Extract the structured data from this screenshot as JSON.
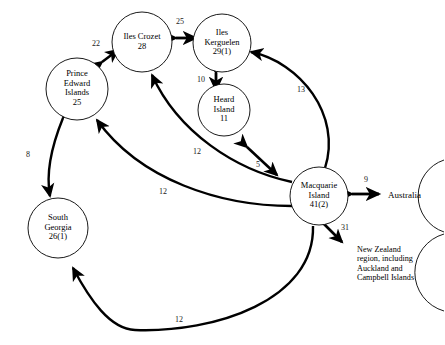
{
  "figure": {
    "type": "network-diagram",
    "background_color": "#ffffff",
    "line_color": "#000000"
  },
  "nodes": [
    {
      "id": "prince-edward-islands",
      "label": "Prince\nEdward\nIslands\n25",
      "name": "Prince Edward Islands",
      "value": "25",
      "shape": "circle",
      "cx": 77,
      "cy": 89,
      "r": 31
    },
    {
      "id": "iles-crozet",
      "label": "Iles Crozet\n28",
      "name": "Iles Crozet",
      "value": "28",
      "shape": "circle",
      "cx": 142,
      "cy": 42,
      "r": 30
    },
    {
      "id": "iles-kerguelen",
      "label": "Iles\nKerguelen\n29(1)",
      "name": "Iles Kerguelen",
      "value": "29(1)",
      "shape": "circle",
      "cx": 222,
      "cy": 43,
      "r": 29
    },
    {
      "id": "heard-island",
      "label": "Heard\nIsland\n11",
      "name": "Heard Island",
      "value": "11",
      "shape": "circle",
      "cx": 224,
      "cy": 110,
      "r": 26
    },
    {
      "id": "macquarie-island",
      "label": "Macquarie\nIsland\n41(2)",
      "name": "Macquarie Island",
      "value": "41(2)",
      "shape": "circle",
      "cx": 319,
      "cy": 196,
      "r": 29
    },
    {
      "id": "south-georgia",
      "label": "South\nGeorgia\n26(1)",
      "name": "South Georgia",
      "value": "26(1)",
      "shape": "circle",
      "cx": 58,
      "cy": 228,
      "r": 30
    },
    {
      "id": "australia",
      "label": "Australia",
      "name": "Australia",
      "shape": "arc-open-right",
      "cx": 420,
      "cy": 196,
      "r": 38
    },
    {
      "id": "new-zealand-region",
      "label": "New Zealand\nregion, including\nAuckland and\nCampbell Islands",
      "name": "New Zealand region",
      "shape": "arc-open-right",
      "cx": 420,
      "cy": 272,
      "r": 40
    }
  ],
  "edges": [
    {
      "id": "crozet-kerguelen",
      "label": "25",
      "from": "iles-crozet",
      "to": "iles-kerguelen",
      "arrows": "double",
      "style": "straight",
      "label_x": 179,
      "label_y": 22
    },
    {
      "id": "prince-edward-crozet",
      "label": "22",
      "from": "prince-edward-islands",
      "to": "iles-crozet",
      "arrows": "double",
      "style": "straight-diagonal",
      "label_x": 95,
      "label_y": 44
    },
    {
      "id": "kerguelen-heard",
      "label": "10",
      "from": "iles-kerguelen",
      "to": "heard-island",
      "arrows": "double",
      "style": "straight",
      "label_x": 200,
      "label_y": 80
    },
    {
      "id": "heard-macquarie",
      "label": "5",
      "from": "heard-island",
      "to": "macquarie-island",
      "arrows": "double",
      "style": "straight-diagonal",
      "label_x": 258,
      "label_y": 165
    },
    {
      "id": "macquarie-kerguelen",
      "label": "13",
      "from": "macquarie-island",
      "to": "iles-kerguelen",
      "arrows": "double",
      "style": "curved",
      "label_x": 300,
      "label_y": 90
    },
    {
      "id": "macquarie-crozet",
      "label": "12",
      "from": "macquarie-island",
      "to": "iles-crozet",
      "arrows": "single",
      "style": "curved",
      "label_x": 196,
      "label_y": 152
    },
    {
      "id": "macquarie-prince-edward",
      "label": "12",
      "from": "macquarie-island",
      "to": "prince-edward-islands",
      "arrows": "single",
      "style": "curved",
      "label_x": 162,
      "label_y": 192
    },
    {
      "id": "macquarie-south-georgia",
      "label": "12",
      "from": "macquarie-island",
      "to": "south-georgia",
      "arrows": "single",
      "style": "curved",
      "label_x": 178,
      "label_y": 320
    },
    {
      "id": "prince-edward-south-georgia",
      "label": "8",
      "from": "prince-edward-islands",
      "to": "south-georgia",
      "arrows": "double",
      "style": "curved",
      "label_x": 28,
      "label_y": 155
    },
    {
      "id": "macquarie-australia",
      "label": "9",
      "from": "macquarie-island",
      "to": "australia",
      "arrows": "double",
      "style": "straight",
      "label_x": 365,
      "label_y": 180
    },
    {
      "id": "macquarie-new-zealand",
      "label": "31",
      "from": "macquarie-island",
      "to": "new-zealand-region",
      "arrows": "double",
      "style": "straight-diagonal",
      "label_x": 344,
      "label_y": 228
    }
  ]
}
